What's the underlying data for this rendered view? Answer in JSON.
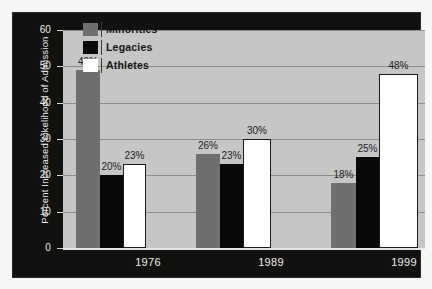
{
  "chart_data": {
    "type": "bar",
    "title": "",
    "subtitle": "",
    "xlabel": "",
    "ylabel": "Percent Increased Likelihood of Admission",
    "categories": [
      "1976",
      "1989",
      "1999"
    ],
    "series": [
      {
        "name": "Minorities",
        "color": "#706f70",
        "values": [
          49,
          26,
          18
        ],
        "labels": [
          "49%",
          "26%",
          "18%"
        ]
      },
      {
        "name": "Legacies",
        "color": "#090909",
        "values": [
          20,
          23,
          25
        ],
        "labels": [
          "20%",
          "23%",
          "25%"
        ]
      },
      {
        "name": "Athletes",
        "color": "#ffffff",
        "values": [
          23,
          30,
          48
        ],
        "labels": [
          "23%",
          "30%",
          "48%"
        ]
      }
    ],
    "ylim": [
      0,
      60
    ],
    "yticks": [
      0,
      10,
      20,
      30,
      40,
      50,
      60
    ],
    "ytick_labels": [
      "0",
      "10",
      "20",
      "30",
      "40",
      "50",
      "60"
    ],
    "grid": true,
    "grid_axis": "y",
    "legend_position": "top-left-inside",
    "plot_background": "#c6c6c6",
    "panel_background": "#111110",
    "gridline_color": "#8c8c8c",
    "axis_text_color": "#ededea",
    "data_label_color": "#1c1c1c"
  },
  "legend": {
    "items": [
      {
        "label": "Minorities",
        "swatch": "minorities"
      },
      {
        "label": "Legacies",
        "swatch": "legacies"
      },
      {
        "label": "Athletes",
        "swatch": "athletes"
      }
    ]
  }
}
